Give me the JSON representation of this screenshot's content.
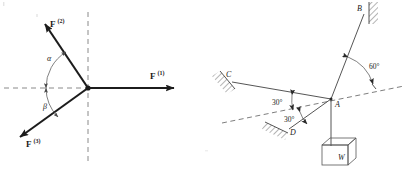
{
  "figure": {
    "background_color": "#ffffff",
    "line_color": "#1c1c1c",
    "dash_color": "#8a8a8a"
  },
  "left_diagram": {
    "name": "concurrent-force-vectors",
    "origin": {
      "x": 88,
      "y": 88
    },
    "vectors": [
      {
        "key": "F1",
        "base": "F",
        "superscript": "(1)",
        "label_x": 152,
        "label_y": 77,
        "tip_x": 181,
        "tip_y": 88,
        "direction_deg": 0
      },
      {
        "key": "F2",
        "base": "F",
        "superscript": "(2)",
        "label_x": 52,
        "label_y": 25,
        "tip_x": 39,
        "tip_y": 19,
        "direction_deg": 125
      },
      {
        "key": "F3",
        "base": "F",
        "superscript": "(3)",
        "label_x": 28,
        "label_y": 145,
        "tip_x": 14,
        "tip_y": 140,
        "direction_deg": 221
      }
    ],
    "angles": [
      {
        "key": "alpha",
        "symbol": "α",
        "x": 49,
        "y": 59
      },
      {
        "key": "beta",
        "symbol": "β",
        "x": 45,
        "y": 107
      }
    ],
    "axes": {
      "horizontal_dashed": {
        "x1": 4,
        "y1": 88,
        "x2": 96,
        "y2": 88
      },
      "vertical_dashed": {
        "x1": 88,
        "y1": 12,
        "x2": 88,
        "y2": 164
      }
    }
  },
  "right_diagram": {
    "name": "suspended-weight-rigging",
    "joint": {
      "key": "A",
      "label": "A",
      "x": 331,
      "y": 99,
      "label_x": 336,
      "label_y": 106
    },
    "points": [
      {
        "key": "B",
        "label": "B",
        "x": 364,
        "y": 13,
        "label_x": 358,
        "label_y": 11
      },
      {
        "key": "C",
        "label": "C",
        "x": 228,
        "y": 80,
        "label_x": 227,
        "label_y": 77
      },
      {
        "key": "D",
        "label": "D",
        "x": 287,
        "y": 131,
        "label_x": 290,
        "label_y": 134
      }
    ],
    "angles": [
      {
        "key": "angle-60",
        "label": "60°",
        "x": 372,
        "y": 66
      },
      {
        "key": "angle-30-upper",
        "label": "30°",
        "x": 283,
        "y": 103
      },
      {
        "key": "angle-30-lower",
        "label": "30°",
        "x": 295,
        "y": 120
      }
    ],
    "weight": {
      "key": "W",
      "label": "W",
      "label_x": 345,
      "label_y": 160,
      "box_x": 322,
      "box_y": 138,
      "box_w": 34,
      "box_h": 26
    },
    "reference_line": {
      "name": "dashed-reference-axis",
      "x1": 222,
      "y1": 123,
      "x2": 404,
      "y2": 86
    },
    "supports": [
      {
        "key": "support-B",
        "label": "wall-hatch-B"
      },
      {
        "key": "support-C",
        "label": "wall-hatch-C"
      },
      {
        "key": "support-D",
        "label": "wall-hatch-D"
      }
    ]
  }
}
